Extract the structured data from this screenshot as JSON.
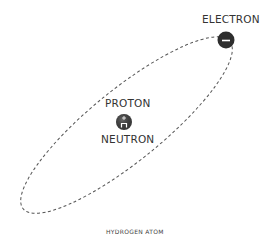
{
  "diagram": {
    "title": "Hydrogen atom",
    "caption": "Hydrogen atom",
    "labels": {
      "electron": "ELECTRON",
      "proton": "PROTON",
      "neutron": "NEUTRON"
    },
    "symbols": {
      "electron": "−",
      "proton": "+",
      "neutron": "n"
    },
    "colors": {
      "orbit": "#555555",
      "particle": "#333333",
      "particle_symbol": "#ffffff",
      "text": "#333333"
    }
  }
}
